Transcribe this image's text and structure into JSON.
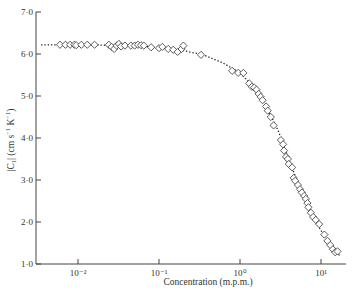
{
  "chart_data": {
    "type": "scatter",
    "title": "",
    "xlabel": "Concentration (m.p.m.)",
    "ylabel": "|C1| (cm s⁻¹ K⁻¹)",
    "x_scale": "log",
    "xlim": [
      0.003,
      20
    ],
    "ylim": [
      1.0,
      7.0
    ],
    "x_ticks": [
      {
        "value": 0.01,
        "label": "10⁻²"
      },
      {
        "value": 0.1,
        "label": "10⁻¹"
      },
      {
        "value": 1,
        "label": "10⁰"
      },
      {
        "value": 10,
        "label": "10¹"
      }
    ],
    "y_ticks": [
      {
        "value": 1.0,
        "label": "1·0"
      },
      {
        "value": 2.0,
        "label": "2·0"
      },
      {
        "value": 3.0,
        "label": "3·0"
      },
      {
        "value": 4.0,
        "label": "4·0"
      },
      {
        "value": 5.0,
        "label": "5·0"
      },
      {
        "value": 6.0,
        "label": "6·0"
      },
      {
        "value": 7.0,
        "label": "7·0"
      }
    ],
    "grid": false,
    "legend": null,
    "series": [
      {
        "name": "measured",
        "marker": "diamond-open",
        "points": [
          [
            0.006,
            6.22
          ],
          [
            0.007,
            6.22
          ],
          [
            0.008,
            6.22
          ],
          [
            0.009,
            6.22
          ],
          [
            0.0095,
            6.21
          ],
          [
            0.011,
            6.22
          ],
          [
            0.013,
            6.22
          ],
          [
            0.016,
            6.22
          ],
          [
            0.024,
            6.22
          ],
          [
            0.026,
            6.17
          ],
          [
            0.028,
            6.12
          ],
          [
            0.03,
            6.2
          ],
          [
            0.032,
            6.24
          ],
          [
            0.034,
            6.18
          ],
          [
            0.038,
            6.2
          ],
          [
            0.045,
            6.2
          ],
          [
            0.05,
            6.2
          ],
          [
            0.055,
            6.22
          ],
          [
            0.06,
            6.21
          ],
          [
            0.065,
            6.2
          ],
          [
            0.08,
            6.16
          ],
          [
            0.1,
            6.14
          ],
          [
            0.11,
            6.17
          ],
          [
            0.13,
            6.12
          ],
          [
            0.15,
            6.1
          ],
          [
            0.17,
            6.05
          ],
          [
            0.19,
            6.12
          ],
          [
            0.2,
            6.2
          ],
          [
            0.33,
            5.98
          ],
          [
            0.8,
            5.6
          ],
          [
            0.95,
            5.55
          ],
          [
            1.1,
            5.55
          ],
          [
            1.3,
            5.3
          ],
          [
            1.4,
            5.22
          ],
          [
            1.5,
            5.2
          ],
          [
            1.6,
            5.15
          ],
          [
            1.7,
            5.05
          ],
          [
            1.8,
            4.98
          ],
          [
            1.9,
            4.9
          ],
          [
            2.1,
            4.75
          ],
          [
            2.2,
            4.65
          ],
          [
            2.4,
            4.5
          ],
          [
            2.6,
            4.3
          ],
          [
            3.2,
            3.95
          ],
          [
            3.4,
            3.85
          ],
          [
            3.5,
            3.7
          ],
          [
            3.7,
            3.55
          ],
          [
            3.9,
            3.5
          ],
          [
            4.0,
            3.38
          ],
          [
            4.4,
            3.3
          ],
          [
            4.6,
            3.05
          ],
          [
            4.8,
            2.98
          ],
          [
            5.2,
            2.88
          ],
          [
            5.5,
            2.78
          ],
          [
            5.8,
            2.7
          ],
          [
            6.2,
            2.62
          ],
          [
            6.5,
            2.55
          ],
          [
            6.8,
            2.45
          ],
          [
            7.0,
            2.35
          ],
          [
            7.5,
            2.22
          ],
          [
            8.0,
            2.12
          ],
          [
            8.6,
            2.05
          ],
          [
            9.5,
            1.95
          ],
          [
            11,
            1.7
          ],
          [
            12,
            1.55
          ],
          [
            13,
            1.45
          ],
          [
            14,
            1.35
          ],
          [
            15,
            1.28
          ],
          [
            16,
            1.3
          ]
        ]
      },
      {
        "name": "fit",
        "style": "dotted-line",
        "points": [
          [
            0.0035,
            6.22
          ],
          [
            0.01,
            6.22
          ],
          [
            0.03,
            6.21
          ],
          [
            0.06,
            6.19
          ],
          [
            0.1,
            6.15
          ],
          [
            0.2,
            6.08
          ],
          [
            0.35,
            5.98
          ],
          [
            0.6,
            5.8
          ],
          [
            1.0,
            5.55
          ],
          [
            1.5,
            5.2
          ],
          [
            2.0,
            4.85
          ],
          [
            3.0,
            4.15
          ],
          [
            4.0,
            3.5
          ],
          [
            6.0,
            2.6
          ],
          [
            8.0,
            2.1
          ],
          [
            10.0,
            1.8
          ],
          [
            13.0,
            1.45
          ],
          [
            17.0,
            1.2
          ]
        ]
      }
    ]
  },
  "axes": {
    "x_title": "Concentration (m.p.m.)",
    "y_title_main": "|C",
    "y_title_sub": "1",
    "y_title_rest": "| (cm s",
    "y_title_exp1": "−1",
    "y_title_k": " K",
    "y_title_exp2": "−1",
    "y_title_close": ")"
  }
}
